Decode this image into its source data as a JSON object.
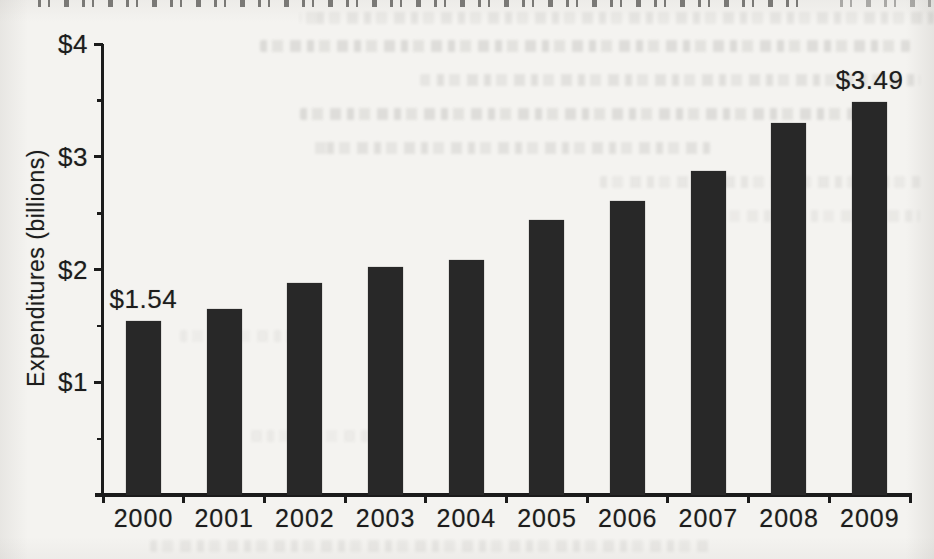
{
  "chart_data": {
    "type": "bar",
    "title": "",
    "ylabel": "Expenditures (billions)",
    "xlabel": "",
    "categories": [
      "2000",
      "2001",
      "2002",
      "2003",
      "2004",
      "2005",
      "2006",
      "2007",
      "2008",
      "2009"
    ],
    "values": [
      1.54,
      1.65,
      1.88,
      2.02,
      2.08,
      2.44,
      2.61,
      2.87,
      3.3,
      3.49
    ],
    "bar_value_labels": [
      {
        "category": "2000",
        "text": "$1.54"
      },
      {
        "category": "2009",
        "text": "$3.49"
      }
    ],
    "ylim": [
      0,
      4
    ],
    "y_major_ticks": [
      1,
      2,
      3,
      4
    ],
    "y_tick_labels": [
      "$1",
      "$2",
      "$3",
      "$4"
    ],
    "y_minor_tick_step": 0.5,
    "grid": false,
    "legend": "none",
    "colors": {
      "bar": "#282828",
      "axis": "#1b1b1b",
      "text": "#1c1c1c",
      "paper": "#f4f3f0"
    }
  }
}
